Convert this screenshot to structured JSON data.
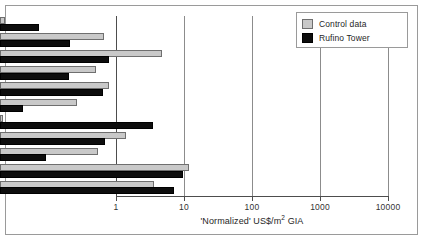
{
  "chart_data": {
    "type": "bar",
    "orientation": "horizontal",
    "title": "",
    "xlabel": "'Normalized' US$/m² GIA",
    "ylabel": "",
    "xscale": "log",
    "xlim": [
      1,
      10000
    ],
    "xticks": [
      1,
      10,
      100,
      1000,
      10000
    ],
    "xticklabels": [
      "1",
      "10",
      "100",
      "1000",
      "10000"
    ],
    "grid": true,
    "grid_axis": "x",
    "legend_position": "top-right",
    "categories": [
      "Demolition",
      "Insurances",
      "Churn",
      "Cleaning",
      "Caretaking/security",
      "Water and sewerage",
      "Energy",
      "Maintenance",
      "Replacement",
      "Construction (active)",
      "Construction (passive)"
    ],
    "series": [
      {
        "name": "Control data",
        "color": "#c9c9c9",
        "values": [
          1.2,
          34,
          240,
          26,
          40,
          13.5,
          1.1,
          72,
          28,
          600,
          185
        ]
      },
      {
        "name": "Rufino Tower",
        "color": "#0d0d0d",
        "values": [
          3.7,
          10.7,
          40,
          10.3,
          33,
          2.2,
          180,
          35,
          4.8,
          490,
          360
        ]
      }
    ]
  },
  "legend": {
    "items": [
      {
        "label": "Control data",
        "swatch": "control"
      },
      {
        "label": "Rufino Tower",
        "swatch": "rufino"
      }
    ]
  }
}
